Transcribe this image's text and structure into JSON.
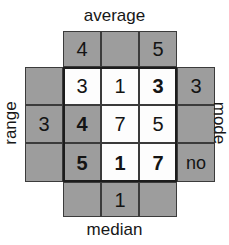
{
  "figure": {
    "kind": "cross-number-puzzle",
    "colors": {
      "shaded_cell": "#9d9d9d",
      "open_cell": "#fdfdfd",
      "grid_line": "#3b3b3b",
      "heavy_outline": "#1c1c1c",
      "text": "#141414"
    }
  },
  "clues": {
    "top": "average",
    "bottom": "median",
    "left": "range",
    "right": "mode"
  },
  "top_row": {
    "cells": [
      {
        "value": "4",
        "shaded": true,
        "bold": false
      },
      {
        "value": "",
        "shaded": true,
        "bold": false
      },
      {
        "value": "5",
        "shaded": true,
        "bold": false
      }
    ]
  },
  "bottom_row": {
    "cells": [
      {
        "value": "",
        "shaded": true,
        "bold": false
      },
      {
        "value": "1",
        "shaded": true,
        "bold": false
      },
      {
        "value": "",
        "shaded": true,
        "bold": false
      }
    ]
  },
  "left_column": {
    "cells": [
      {
        "value": "",
        "shaded": true,
        "bold": false
      },
      {
        "value": "3",
        "shaded": true,
        "bold": false
      },
      {
        "value": "",
        "shaded": true,
        "bold": false
      }
    ]
  },
  "right_column": {
    "cells": [
      {
        "value": "3",
        "shaded": true,
        "bold": false
      },
      {
        "value": "",
        "shaded": true,
        "bold": false
      },
      {
        "value": "no",
        "shaded": true,
        "bold": false
      }
    ]
  },
  "grid": {
    "rows": [
      {
        "cells": [
          {
            "value": "3",
            "shaded": false,
            "bold": false
          },
          {
            "value": "1",
            "shaded": false,
            "bold": false
          },
          {
            "value": "3",
            "shaded": false,
            "bold": true
          }
        ]
      },
      {
        "cells": [
          {
            "value": "4",
            "shaded": true,
            "bold": true
          },
          {
            "value": "7",
            "shaded": false,
            "bold": false
          },
          {
            "value": "5",
            "shaded": false,
            "bold": false
          }
        ]
      },
      {
        "cells": [
          {
            "value": "5",
            "shaded": true,
            "bold": true
          },
          {
            "value": "1",
            "shaded": false,
            "bold": true
          },
          {
            "value": "7",
            "shaded": false,
            "bold": true
          }
        ]
      }
    ]
  }
}
